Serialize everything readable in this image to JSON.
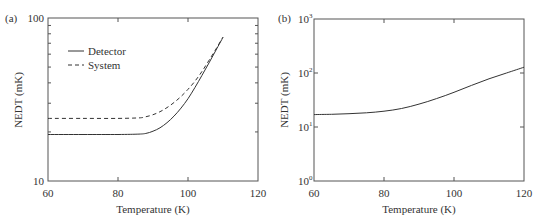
{
  "chart_data": [
    {
      "type": "line",
      "panel_label": "(a)",
      "title": "",
      "xlabel": "Temperature (K)",
      "ylabel": "NEDT (mK)",
      "xlim": [
        60,
        120
      ],
      "ylim": [
        10,
        100
      ],
      "yscale": "log",
      "xticks": [
        60,
        80,
        100,
        120
      ],
      "yticks": [
        10,
        100
      ],
      "ytick_labels": [
        "10",
        "100"
      ],
      "grid": false,
      "legend_position": "upper left",
      "series": [
        {
          "name": "Detector",
          "style": "solid",
          "x": [
            60,
            70,
            80,
            86,
            88,
            90,
            92,
            94,
            96,
            98,
            100,
            102,
            104,
            106,
            108,
            110
          ],
          "y": [
            19.3,
            19.3,
            19.3,
            19.4,
            19.6,
            20.2,
            21.2,
            22.8,
            25.0,
            28.0,
            32.0,
            37.5,
            44.5,
            53.0,
            63.5,
            76.0
          ]
        },
        {
          "name": "System",
          "style": "dashed",
          "x": [
            60,
            70,
            80,
            86,
            88,
            90,
            92,
            94,
            96,
            98,
            100,
            102,
            104,
            106,
            108,
            110
          ],
          "y": [
            24.2,
            24.2,
            24.2,
            24.4,
            24.8,
            25.5,
            26.6,
            28.2,
            30.3,
            33.0,
            36.5,
            41.0,
            47.0,
            55.0,
            64.5,
            76.5
          ]
        }
      ]
    },
    {
      "type": "line",
      "panel_label": "(b)",
      "title": "",
      "xlabel": "Temperature (K)",
      "ylabel": "NEDT (mK)",
      "xlim": [
        60,
        120
      ],
      "ylim": [
        1,
        1000
      ],
      "yscale": "log",
      "xticks": [
        60,
        80,
        100,
        120
      ],
      "yticks": [
        1,
        10,
        100,
        1000
      ],
      "ytick_labels": [
        "10^0",
        "10^1",
        "10^2",
        "10^3"
      ],
      "grid": false,
      "series": [
        {
          "name": "NEDT",
          "style": "solid",
          "x": [
            60,
            65,
            70,
            75,
            80,
            85,
            90,
            95,
            100,
            105,
            110,
            115,
            120
          ],
          "y": [
            17.0,
            17.2,
            17.6,
            18.3,
            19.6,
            22.0,
            26.5,
            33.5,
            44.0,
            59.0,
            78.0,
            100.0,
            128.0
          ]
        }
      ]
    }
  ],
  "labels": {
    "a": {
      "panel": "(a)",
      "xlabel": "Temperature (K)",
      "ylabel": "NEDT (mK)",
      "xticks": [
        "60",
        "80",
        "100",
        "120"
      ],
      "yticks": [
        "10",
        "100"
      ],
      "legend": [
        "Detector",
        "System"
      ]
    },
    "b": {
      "panel": "(b)",
      "xlabel": "Temperature (K)",
      "ylabel": "NEDT (mK)",
      "xticks": [
        "60",
        "80",
        "100",
        "120"
      ],
      "yticks_base": [
        "10",
        "10",
        "10",
        "10"
      ],
      "yticks_exp": [
        "0",
        "1",
        "2",
        "3"
      ]
    }
  },
  "colors": {
    "line": "#333333",
    "axis": "#555555"
  }
}
